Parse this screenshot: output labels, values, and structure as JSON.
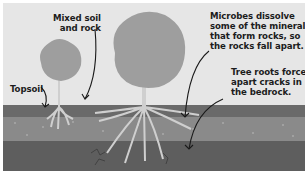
{
  "diagram": {
    "colors": {
      "background": "#e6e6e6",
      "topsoil": "#6a6a6a",
      "mixed_layer": "#8a8a8a",
      "bedrock": "#5e5e5e",
      "canopy": "#9e9e9e",
      "trunk_roots": "#cfcfcf",
      "arrow": "#1a1a1a"
    },
    "labels": {
      "mixed_soil": [
        "Mixed soil",
        "and rock"
      ],
      "topsoil": "Topsoil",
      "microbes": [
        "Microbes dissolve",
        "some of the minerals",
        "that form rocks, so",
        "the rocks fall apart."
      ],
      "tree_roots": [
        "Tree roots force",
        "apart cracks in",
        "the bedrock."
      ]
    },
    "layers": [
      "Topsoil",
      "Mixed soil and rock",
      "Bedrock"
    ],
    "trees": [
      {
        "name": "small-tree",
        "size": "small"
      },
      {
        "name": "large-tree",
        "size": "large"
      }
    ]
  }
}
